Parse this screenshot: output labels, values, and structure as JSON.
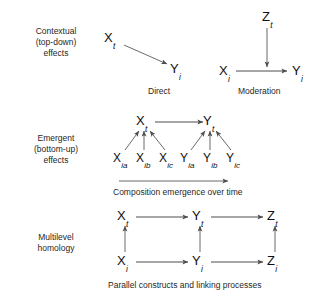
{
  "figure": {
    "background": "#ffffff",
    "stroke_color": "#4d4d4d",
    "text_color": "#1a1a1a"
  },
  "panels": [
    {
      "id": "contextual",
      "label_line1": "Contextual",
      "label_line2": "(top-down)",
      "label_line3": "effects",
      "captions": {
        "direct": "Direct",
        "moderation": "Moderation"
      },
      "nodes": {
        "direct_x": {
          "base": "X",
          "sub": "t"
        },
        "direct_y": {
          "base": "Y",
          "sub": "i"
        },
        "mod_x": {
          "base": "X",
          "sub": "i"
        },
        "mod_y": {
          "base": "Y",
          "sub": "i"
        },
        "mod_z": {
          "base": "Z",
          "sub": "t"
        }
      }
    },
    {
      "id": "emergent",
      "label_line1": "Emergent",
      "label_line2": "(bottom-up)",
      "label_line3": "effects",
      "captions": {
        "timeline": "Composition emergence over time"
      },
      "nodes": {
        "xt": {
          "base": "X",
          "sub": "t"
        },
        "yt": {
          "base": "Y",
          "sub": "t"
        },
        "xia": {
          "base": "X",
          "sub": "ia"
        },
        "xib": {
          "base": "X",
          "sub": "ib"
        },
        "xic": {
          "base": "X",
          "sub": "ic"
        },
        "yia": {
          "base": "Y",
          "sub": "ia"
        },
        "yib": {
          "base": "Y",
          "sub": "ib"
        },
        "yic": {
          "base": "Y",
          "sub": "ic"
        }
      }
    },
    {
      "id": "homology",
      "label_line1": "Multilevel",
      "label_line2": "homology",
      "label_line3": "",
      "captions": {
        "bottom": "Parallel constructs and linking processes"
      },
      "nodes": {
        "xt": {
          "base": "X",
          "sub": "t"
        },
        "yt": {
          "base": "Y",
          "sub": "t"
        },
        "zt": {
          "base": "Z",
          "sub": "t"
        },
        "xi": {
          "base": "X",
          "sub": "i"
        },
        "yi": {
          "base": "Y",
          "sub": "i"
        },
        "zi": {
          "base": "Z",
          "sub": "i"
        }
      }
    }
  ]
}
